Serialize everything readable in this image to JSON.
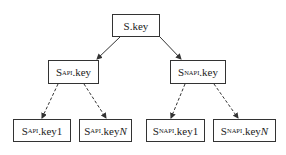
{
  "diagram": {
    "type": "tree",
    "root": {
      "id": "root",
      "base": "S",
      "sub": "",
      "suffix": ".key",
      "italic_suffix": ""
    },
    "level1": [
      {
        "id": "api",
        "base": "S",
        "sub": "API",
        "suffix": ".key",
        "italic_suffix": ""
      },
      {
        "id": "napi",
        "base": "S",
        "sub": "NAPI",
        "suffix": ".key",
        "italic_suffix": ""
      }
    ],
    "level2": [
      {
        "id": "api1",
        "parent": "api",
        "base": "S",
        "sub": "API",
        "suffix": ".key1",
        "italic_suffix": ""
      },
      {
        "id": "apiN",
        "parent": "api",
        "base": "S",
        "sub": "API",
        "suffix": ".key",
        "italic_suffix": "N"
      },
      {
        "id": "napi1",
        "parent": "napi",
        "base": "S",
        "sub": "NAPI",
        "suffix": ".key1",
        "italic_suffix": ""
      },
      {
        "id": "napiN",
        "parent": "napi",
        "base": "S",
        "sub": "NAPI",
        "suffix": ".key",
        "italic_suffix": "N"
      }
    ],
    "edges": [
      {
        "from": "root",
        "to": "api",
        "style": "solid"
      },
      {
        "from": "root",
        "to": "napi",
        "style": "solid"
      },
      {
        "from": "api",
        "to": "api1",
        "style": "dashed"
      },
      {
        "from": "api",
        "to": "apiN",
        "style": "dashed"
      },
      {
        "from": "napi",
        "to": "napi1",
        "style": "dashed"
      },
      {
        "from": "napi",
        "to": "napiN",
        "style": "dashed"
      }
    ],
    "colors": {
      "stroke": "#333333",
      "background": "#ffffff",
      "text": "#222222"
    }
  }
}
